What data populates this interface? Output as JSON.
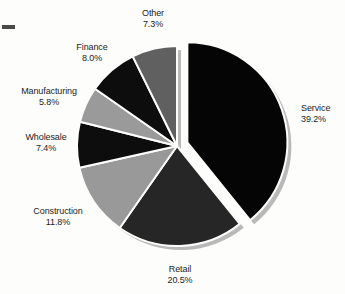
{
  "figure": {
    "background_color": "#fdfdfc",
    "label_color": "#1c1c1c",
    "scan_artifact": "left-margin-dash"
  },
  "chart_data": {
    "type": "pie",
    "title": "",
    "subtitle": "",
    "xlabel": "",
    "ylabel": "",
    "legend_position": "none",
    "labels_position": "outside-callout",
    "grid": false,
    "value_suffix": "%",
    "total": 100.0,
    "exploded_slices": [
      "Service"
    ],
    "start_angle_deg": -90,
    "direction": "clockwise",
    "categories": [
      "Service",
      "Retail",
      "Construction",
      "Wholesale",
      "Manufacturing",
      "Finance",
      "Other"
    ],
    "values": [
      39.2,
      20.5,
      11.8,
      7.4,
      5.8,
      8.0,
      7.3
    ],
    "slices": [
      {
        "name": "Service",
        "value": 39.2,
        "value_label": "39.2%",
        "color": "#050505",
        "exploded": true,
        "label_align": "left"
      },
      {
        "name": "Retail",
        "value": 20.5,
        "value_label": "20.5%",
        "color": "#262626",
        "exploded": false,
        "label_align": "center"
      },
      {
        "name": "Construction",
        "value": 11.8,
        "value_label": "11.8%",
        "color": "#999999",
        "exploded": false,
        "label_align": "center"
      },
      {
        "name": "Wholesale",
        "value": 7.4,
        "value_label": "7.4%",
        "color": "#0d0d0d",
        "exploded": false,
        "label_align": "center"
      },
      {
        "name": "Manufacturing",
        "value": 5.8,
        "value_label": "5.8%",
        "color": "#9a9a9a",
        "exploded": false,
        "label_align": "center"
      },
      {
        "name": "Finance",
        "value": 8.0,
        "value_label": "8.0%",
        "color": "#0d0d0d",
        "exploded": false,
        "label_align": "center"
      },
      {
        "name": "Other",
        "value": 7.3,
        "value_label": "7.3%",
        "color": "#606060",
        "exploded": false,
        "label_align": "center"
      }
    ]
  }
}
